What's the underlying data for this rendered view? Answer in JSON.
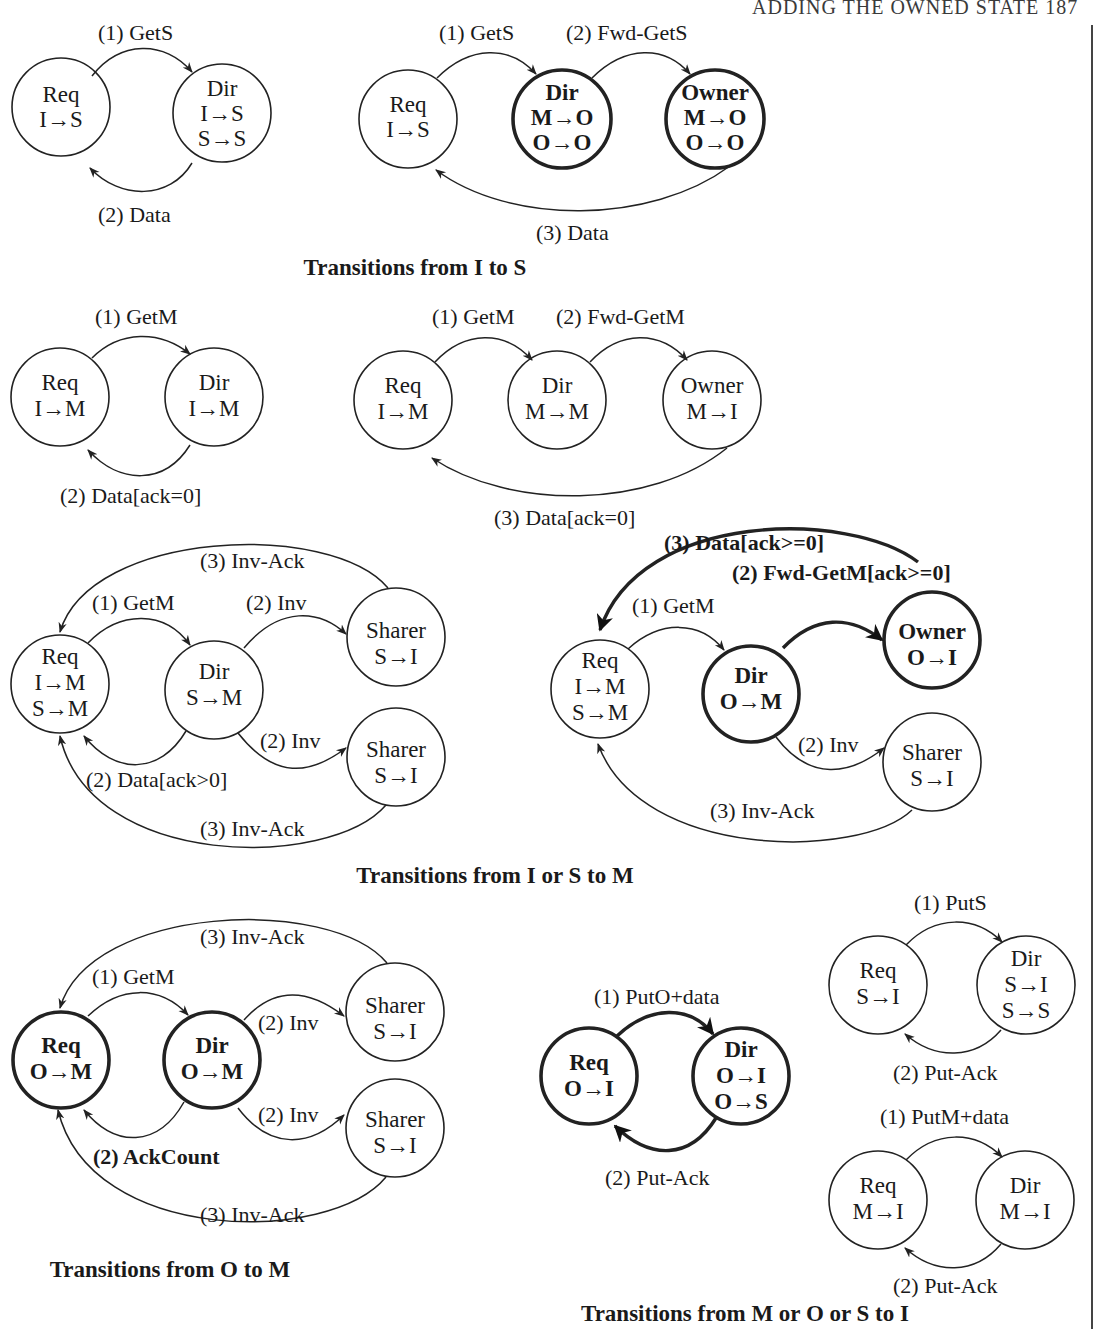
{
  "header": {
    "text": "ADDING THE OWNED STATE   187"
  },
  "captions": {
    "i_to_s": "Transitions from I to S",
    "i_or_s_to_m": "Transitions from I or S to M",
    "o_to_m": "Transitions from O to M",
    "m_o_s_to_i": "Transitions from M or O or S to I"
  },
  "diagrams": {
    "is_a": {
      "req": [
        "Req",
        "I→S"
      ],
      "dir": [
        "Dir",
        "I→S",
        "S→S"
      ],
      "edges": [
        "(1) GetS",
        "(2) Data"
      ]
    },
    "is_b": {
      "req": [
        "Req",
        "I→S"
      ],
      "dir": [
        "Dir",
        "M→O",
        "O→O"
      ],
      "owner": [
        "Owner",
        "M→O",
        "O→O"
      ],
      "edges": [
        "(1) GetS",
        "(2) Fwd-GetS",
        "(3) Data"
      ]
    },
    "im_a": {
      "req": [
        "Req",
        "I→M"
      ],
      "dir": [
        "Dir",
        "I→M"
      ],
      "edges": [
        "(1) GetM",
        "(2) Data[ack=0]"
      ]
    },
    "im_b": {
      "req": [
        "Req",
        "I→M"
      ],
      "dir": [
        "Dir",
        "M→M"
      ],
      "owner": [
        "Owner",
        "M→I"
      ],
      "edges": [
        "(1) GetM",
        "(2) Fwd-GetM",
        "(3) Data[ack=0]"
      ]
    },
    "ism_a": {
      "req": [
        "Req",
        "I→M",
        "S→M"
      ],
      "dir": [
        "Dir",
        "S→M"
      ],
      "sharer1": [
        "Sharer",
        "S→I"
      ],
      "sharer2": [
        "Sharer",
        "S→I"
      ],
      "edges": [
        "(3) Inv-Ack",
        "(1) GetM",
        "(2) Inv",
        "(2) Inv",
        "(2) Data[ack>0]",
        "(3) Inv-Ack"
      ]
    },
    "ism_b": {
      "req": [
        "Req",
        "I→M",
        "S→M"
      ],
      "dir": [
        "Dir",
        "O→M"
      ],
      "owner": [
        "Owner",
        "O→I"
      ],
      "sharer": [
        "Sharer",
        "S→I"
      ],
      "edges": [
        "(3) Data[ack>=0]",
        "(2) Fwd-GetM[ack>=0]",
        "(1) GetM",
        "(2) Inv",
        "(3) Inv-Ack"
      ]
    },
    "om": {
      "req": [
        "Req",
        "O→M"
      ],
      "dir": [
        "Dir",
        "O→M"
      ],
      "sharer1": [
        "Sharer",
        "S→I"
      ],
      "sharer2": [
        "Sharer",
        "S→I"
      ],
      "edges": [
        "(3) Inv-Ack",
        "(1) GetM",
        "(2) Inv",
        "(2) Inv",
        "(2) AckCount",
        "(3) Inv-Ack"
      ]
    },
    "oi": {
      "req": [
        "Req",
        "O→I"
      ],
      "dir": [
        "Dir",
        "O→I",
        "O→S"
      ],
      "edges": [
        "(1) PutO+data",
        "(2) Put-Ack"
      ]
    },
    "si": {
      "req": [
        "Req",
        "S→I"
      ],
      "dir": [
        "Dir",
        "S→I",
        "S→S"
      ],
      "edges": [
        "(1) PutS",
        "(2) Put-Ack"
      ]
    },
    "mi": {
      "req": [
        "Req",
        "M→I"
      ],
      "dir": [
        "Dir",
        "M→I"
      ],
      "edges": [
        "(1) PutM+data",
        "(2) Put-Ack"
      ]
    }
  }
}
